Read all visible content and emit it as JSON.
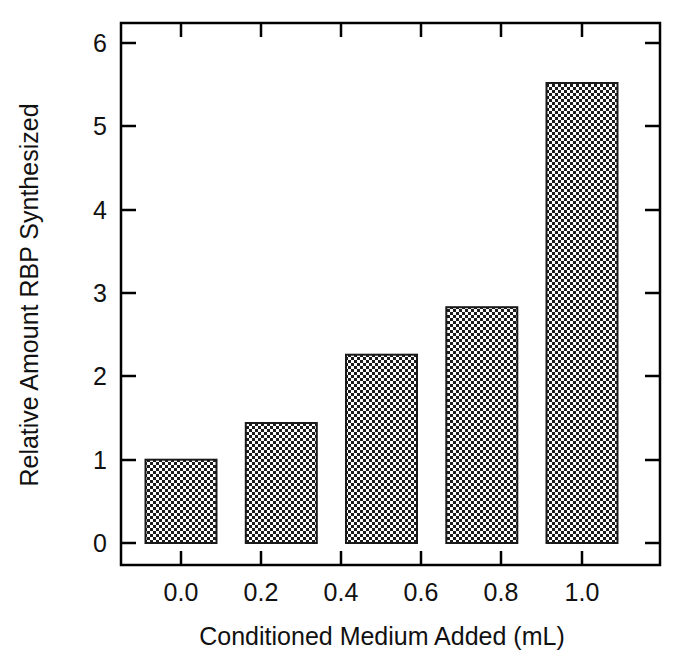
{
  "chart_data": {
    "type": "bar",
    "title": "",
    "subtitle": "",
    "xlabel": "Conditioned Medium Added (mL)",
    "ylabel": "Relative Amount RBP Synthesized",
    "categories": [
      "0.0",
      "0.2",
      "0.5",
      "0.8",
      "1.0"
    ],
    "x": [
      0.0,
      0.25,
      0.5,
      0.75,
      1.0
    ],
    "values": [
      1.0,
      1.44,
      2.26,
      2.83,
      5.52
    ],
    "xlim": [
      -0.1,
      1.2
    ],
    "ylim": [
      0,
      6.5
    ],
    "xticks": [
      "0.0",
      "0.2",
      "0.4",
      "0.6",
      "0.8",
      "1.0"
    ],
    "xtick_values": [
      0.0,
      0.2,
      0.4,
      0.6,
      0.8,
      1.0
    ],
    "yticks": [
      "0",
      "1",
      "2",
      "3",
      "4",
      "5",
      "6"
    ],
    "ytick_values": [
      0,
      1,
      2,
      3,
      4,
      5,
      6
    ],
    "grid": false,
    "legend": "none",
    "bar_fill": "checkerboard-hatch",
    "bar_color": "#1a1a1a",
    "frame_color": "#000000",
    "background": "#ffffff"
  },
  "axes": {
    "y_title": "Relative Amount RBP Synthesized",
    "x_title": "Conditioned Medium Added (mL)",
    "y_tick_labels": [
      "6",
      "5",
      "4",
      "3",
      "2",
      "1",
      "0"
    ],
    "x_tick_labels": [
      "0.0",
      "0.2",
      "0.4",
      "0.6",
      "0.8",
      "1.0"
    ]
  },
  "bars": [
    {
      "label": "0.0",
      "value": "1.00"
    },
    {
      "label": "0.2",
      "value": "1.44"
    },
    {
      "label": "0.5",
      "value": "2.26"
    },
    {
      "label": "0.8",
      "value": "2.83"
    },
    {
      "label": "1.0",
      "value": "5.52"
    }
  ]
}
